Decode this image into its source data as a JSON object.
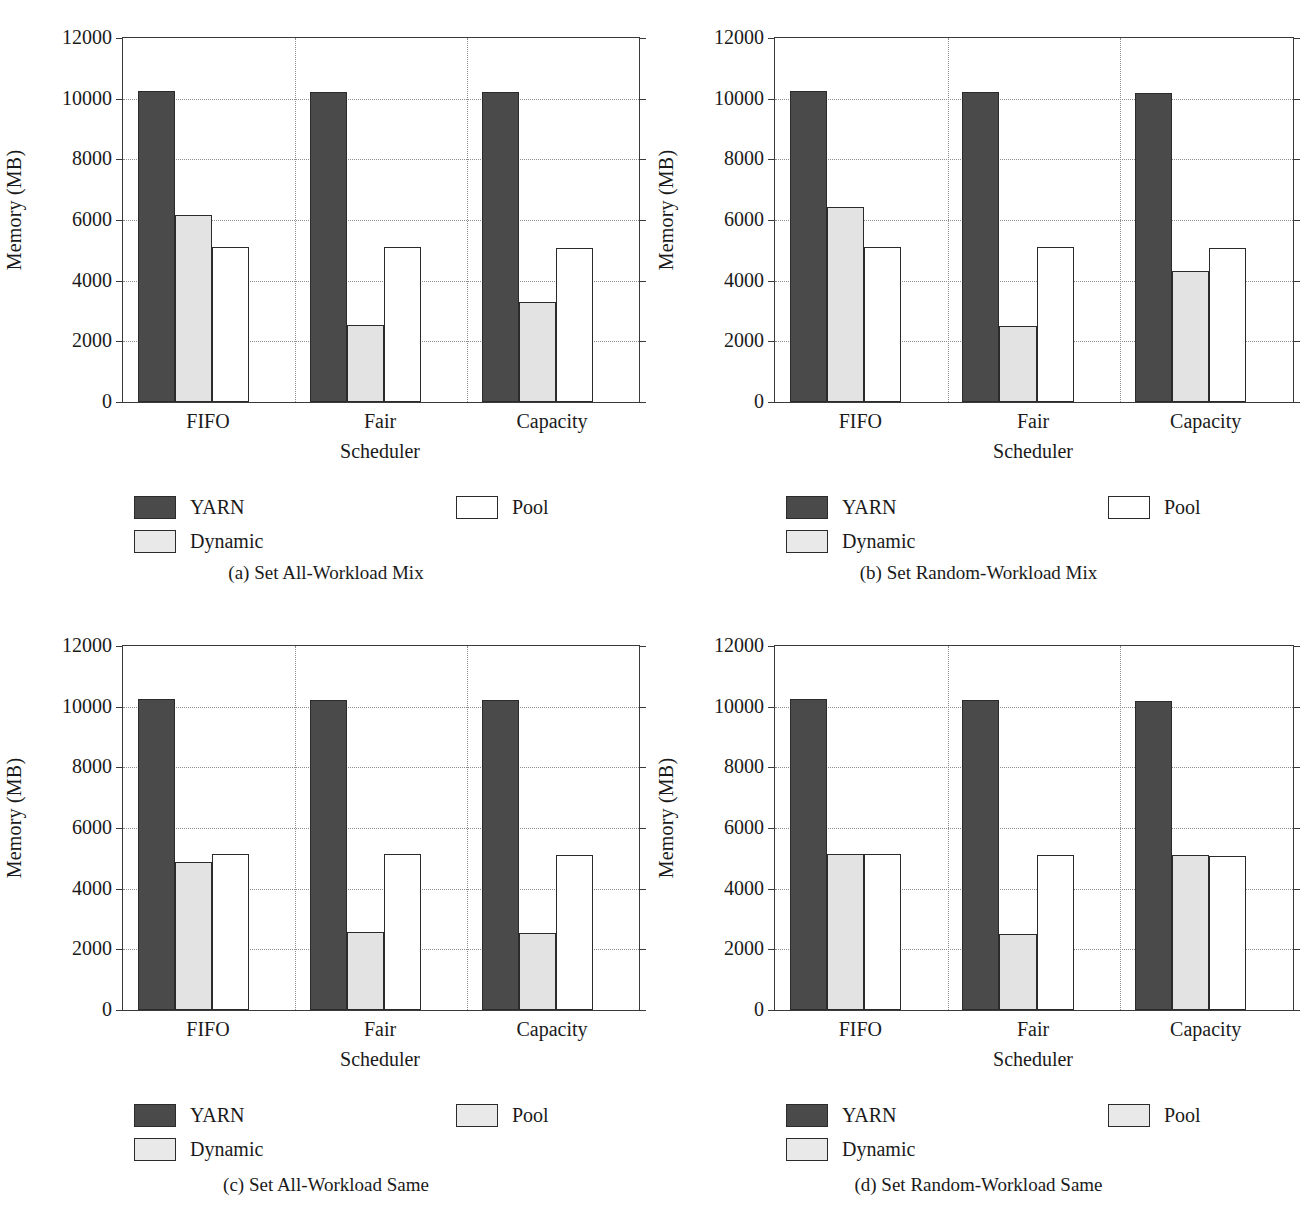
{
  "figure": {
    "axis": {
      "ylabel": "Memory (MB)",
      "xlabel": "Scheduler",
      "yticks": [
        "0",
        "2000",
        "4000",
        "6000",
        "8000",
        "10000",
        "12000"
      ],
      "categories": [
        "FIFO",
        "Fair",
        "Capacity"
      ]
    },
    "legend": {
      "yarn": "YARN",
      "dynamic": "Dynamic",
      "pool": "Pool"
    },
    "captions": {
      "a": "(a)  Set All-Workload Mix",
      "b": "(b)  Set Random-Workload Mix",
      "c": "(c)  Set All-Workload Same",
      "d": "(d)  Set Random-Workload Same"
    }
  },
  "chart_data": [
    {
      "id": "a",
      "type": "bar",
      "title": "(a)  Set All-Workload Mix",
      "xlabel": "Scheduler",
      "ylabel": "Memory (MB)",
      "ylim": [
        0,
        12000
      ],
      "yticks": [
        0,
        2000,
        4000,
        6000,
        8000,
        10000,
        12000
      ],
      "grid": true,
      "legend_position": "below",
      "categories": [
        "FIFO",
        "Fair",
        "Capacity"
      ],
      "series": [
        {
          "name": "YARN",
          "color": "#4a4a4a",
          "values": [
            10240,
            10220,
            10210
          ]
        },
        {
          "name": "Dynamic",
          "color": "#e3e3e3",
          "values": [
            6150,
            2530,
            3290
          ]
        },
        {
          "name": "Pool",
          "color": "#ffffff",
          "values": [
            5120,
            5110,
            5090
          ]
        }
      ]
    },
    {
      "id": "b",
      "type": "bar",
      "title": "(b)  Set Random-Workload Mix",
      "xlabel": "Scheduler",
      "ylabel": "Memory (MB)",
      "ylim": [
        0,
        12000
      ],
      "yticks": [
        0,
        2000,
        4000,
        6000,
        8000,
        10000,
        12000
      ],
      "grid": true,
      "legend_position": "below",
      "categories": [
        "FIFO",
        "Fair",
        "Capacity"
      ],
      "series": [
        {
          "name": "YARN",
          "color": "#4a4a4a",
          "values": [
            10240,
            10220,
            10200
          ]
        },
        {
          "name": "Dynamic",
          "color": "#e3e3e3",
          "values": [
            6420,
            2520,
            4320
          ]
        },
        {
          "name": "Pool",
          "color": "#ffffff",
          "values": [
            5120,
            5100,
            5070
          ]
        }
      ]
    },
    {
      "id": "c",
      "type": "bar",
      "title": "(c)  Set All-Workload Same",
      "xlabel": "Scheduler",
      "ylabel": "Memory (MB)",
      "ylim": [
        0,
        12000
      ],
      "yticks": [
        0,
        2000,
        4000,
        6000,
        8000,
        10000,
        12000
      ],
      "grid": true,
      "legend_position": "below",
      "categories": [
        "FIFO",
        "Fair",
        "Capacity"
      ],
      "series": [
        {
          "name": "YARN",
          "color": "#4a4a4a",
          "values": [
            10240,
            10230,
            10210
          ]
        },
        {
          "name": "Dynamic",
          "color": "#e3e3e3",
          "values": [
            4870,
            2560,
            2540
          ]
        },
        {
          "name": "Pool",
          "color": "#ffffff",
          "values": [
            5140,
            5130,
            5110
          ]
        }
      ]
    },
    {
      "id": "d",
      "type": "bar",
      "title": "(d)  Set Random-Workload Same",
      "xlabel": "Scheduler",
      "ylabel": "Memory (MB)",
      "ylim": [
        0,
        12000
      ],
      "yticks": [
        0,
        2000,
        4000,
        6000,
        8000,
        10000,
        12000
      ],
      "grid": true,
      "legend_position": "below",
      "categories": [
        "FIFO",
        "Fair",
        "Capacity"
      ],
      "series": [
        {
          "name": "YARN",
          "color": "#4a4a4a",
          "values": [
            10240,
            10210,
            10200
          ]
        },
        {
          "name": "Dynamic",
          "color": "#e3e3e3",
          "values": [
            5150,
            2520,
            5120
          ]
        },
        {
          "name": "Pool",
          "color": "#ffffff",
          "values": [
            5150,
            5110,
            5090
          ]
        }
      ]
    }
  ]
}
